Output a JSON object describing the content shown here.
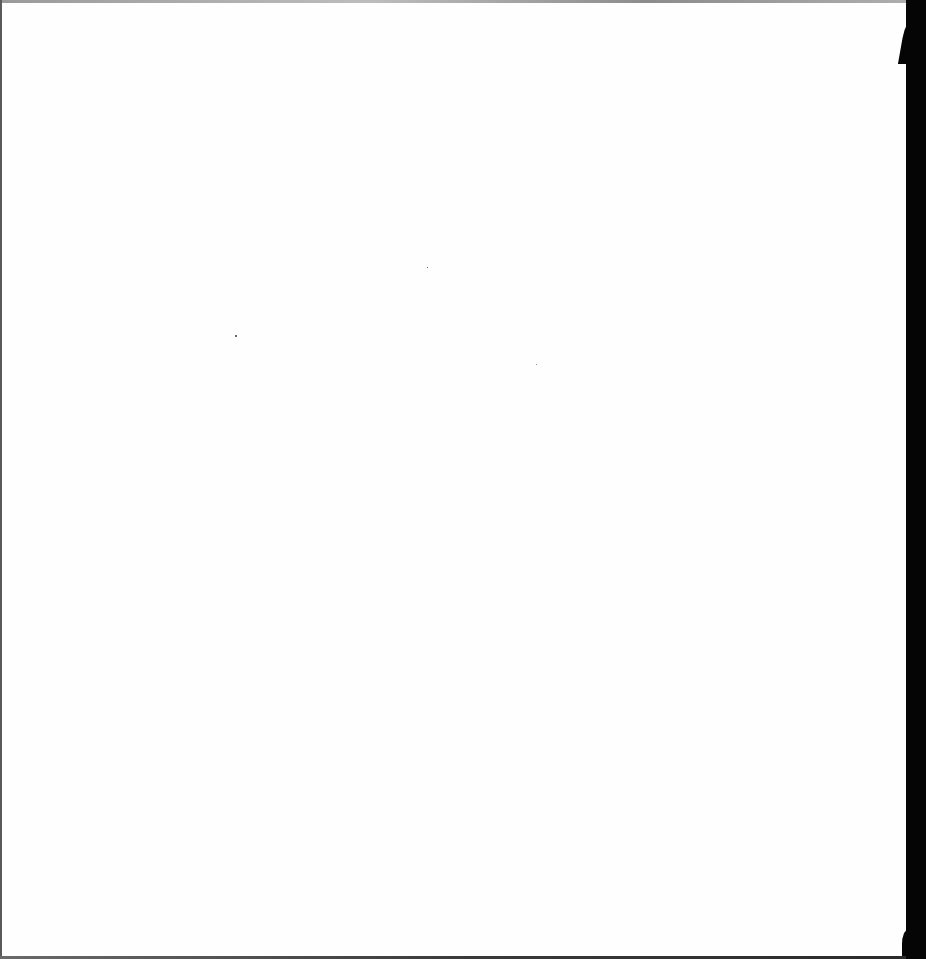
{
  "page": {
    "type": "blank scanned sheet",
    "text_content": "",
    "colors": {
      "paper": "#fefefe",
      "scanner_edge": "#050505",
      "top_border": "#9a9a9a"
    }
  }
}
